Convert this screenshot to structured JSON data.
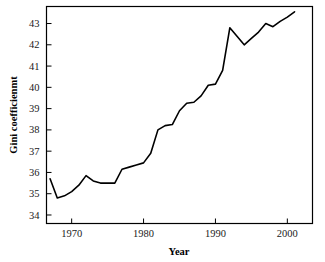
{
  "chart_data": {
    "type": "line",
    "title": "",
    "subtitle": "",
    "xlabel": "Year",
    "ylabel": "Gini coefficienmt",
    "xlim": [
      1966.5,
      2003.5
    ],
    "ylim": [
      33.6,
      43.8
    ],
    "xticks": [
      1970,
      1980,
      1990,
      2000
    ],
    "xtick_labels": [
      "1970",
      "1980",
      "1990",
      "2000"
    ],
    "yticks": [
      34,
      35,
      36,
      37,
      38,
      39,
      40,
      41,
      42,
      43
    ],
    "ytick_labels": [
      "34",
      "35",
      "36",
      "37",
      "38",
      "39",
      "40",
      "41",
      "42",
      "43"
    ],
    "grid": false,
    "legend": null,
    "legend_position": "none",
    "line_color": "#000000",
    "line_width": 1.6,
    "frame_color": "#000000",
    "background": "#ffffff",
    "series": [
      {
        "name": "Gini coefficient",
        "x": [
          1967,
          1968,
          1969,
          1970,
          1971,
          1972,
          1973,
          1974,
          1975,
          1976,
          1977,
          1978,
          1979,
          1980,
          1981,
          1982,
          1983,
          1984,
          1985,
          1986,
          1987,
          1988,
          1989,
          1990,
          1991,
          1992,
          1993,
          1994,
          1995,
          1996,
          1997,
          1998,
          1999,
          2000,
          2001
        ],
        "values": [
          35.7,
          34.8,
          34.9,
          35.1,
          35.4,
          35.85,
          35.6,
          35.5,
          35.5,
          35.5,
          36.15,
          36.25,
          36.35,
          36.45,
          36.9,
          38.0,
          38.2,
          38.25,
          38.9,
          39.25,
          39.3,
          39.6,
          40.1,
          40.15,
          40.8,
          42.8,
          42.4,
          42.0,
          42.3,
          42.6,
          43.0,
          42.85,
          43.1,
          43.3,
          43.55
        ]
      }
    ],
    "annotations": []
  }
}
